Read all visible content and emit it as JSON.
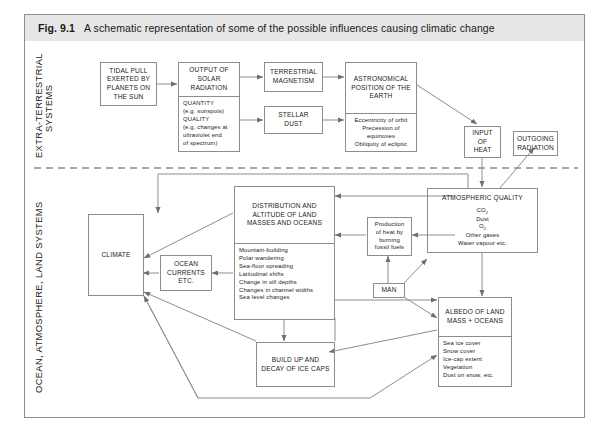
{
  "caption": {
    "figure_number": "Fig. 9.1",
    "text": "A schematic representation of some of the possible influences causing climatic change"
  },
  "bands": [
    {
      "label": "EXTRA-TERRESTRIAL\nSYSTEMS"
    },
    {
      "label": "OCEAN, ATMOSPHERE, LAND SYSTEMS"
    }
  ],
  "boxes": {
    "tidal_pull": {
      "title": "TIDAL PULL EXERTED BY PLANETS ON THE SUN"
    },
    "solar_radiation": {
      "title": "OUTPUT OF SOLAR RADIATION",
      "details": [
        "QUANTITY",
        "(e.g. sunspots)",
        "QUALITY",
        "(e.g. changes at",
        "ultraviolet end",
        "of spectrum)"
      ]
    },
    "terrestrial_magnetism": {
      "title": "TERRESTRIAL MAGNETISM"
    },
    "stellar_dust": {
      "title": "STELLAR DUST"
    },
    "astronomical_position": {
      "title": "ASTRONOMICAL POSITION OF THE EARTH",
      "details": [
        "Eccentricity of orbit",
        "Precession of equinoxes",
        "Obliquity of ecliptic"
      ]
    },
    "input_of_heat": {
      "title": "INPUT OF HEAT"
    },
    "outgoing_radiation": {
      "title": "OUTGOING RADIATION"
    },
    "climate": {
      "title": "CLIMATE"
    },
    "ocean_currents": {
      "title": "OCEAN CURRENTS ETC."
    },
    "land_masses": {
      "title": "DISTRIBUTION AND ALTITUDE OF LAND MASSES AND OCEANS",
      "details": [
        "Mountain-building",
        "Polar wandering",
        "Sea-floor spreading",
        "Latitudinal shifts",
        "Change in sill depths",
        "Changes in channel widths",
        "Sea level changes"
      ]
    },
    "production_of_heat": {
      "title": "Production of heat by burning fossil fuels"
    },
    "man": {
      "title": "MAN"
    },
    "atmospheric_quality": {
      "title": "ATMOSPHERIC QUALITY",
      "details_html": [
        "CO<sub>2</sub>",
        "Dust",
        "O<sub>2</sub>",
        "Other gases",
        "Water vapour etc."
      ]
    },
    "albedo": {
      "title": "ALBEDO OF LAND MASS + OCEANS",
      "details": [
        "Sea ice cover",
        "Snow cover",
        "Ice-cap extent",
        "Vegetation",
        "Dust on snow, etc."
      ]
    },
    "ice_caps": {
      "title": "BUILD UP AND DECAY OF ICE CAPS"
    }
  },
  "colors": {
    "caption_background": "#e6e6e6",
    "line": "#8d8d8d",
    "text": "#222222",
    "page_background": "#ffffff"
  }
}
